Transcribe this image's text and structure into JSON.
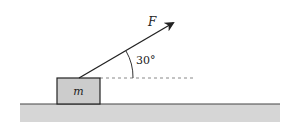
{
  "diagram": {
    "force_label": "F",
    "angle_label": "30°",
    "mass_label": "m",
    "colors": {
      "ground": "#d6d6d6",
      "ground_line": "#444444",
      "block": "#cccccc",
      "stroke": "#222222",
      "dashed": "#888888"
    }
  }
}
